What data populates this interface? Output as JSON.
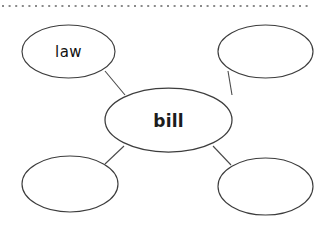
{
  "page": {
    "background_color": "#ffffff",
    "width": 329,
    "height": 230
  },
  "divider": {
    "name": "dotted-rule",
    "style": "dotted",
    "color": "#8a8a8a",
    "y": 6,
    "x_start": 2,
    "x_end": 310,
    "dot_size": 2,
    "dot_gap": 5
  },
  "diagram": {
    "type": "word-web",
    "stroke_color": "#404040",
    "fill_color": "#ffffff",
    "connector_color": "#4a4a4a",
    "center": {
      "id": "center-bubble",
      "label": "bill",
      "cx": 168.5,
      "cy": 120,
      "rx": 63.5,
      "ry": 32,
      "filled": true
    },
    "nodes": [
      {
        "id": "bubble-top-left",
        "label": "law",
        "cx": 68.5,
        "cy": 51.5,
        "rx": 46.5,
        "ry": 26.5,
        "filled": true
      },
      {
        "id": "bubble-top-right",
        "label": "",
        "cx": 265.5,
        "cy": 51.5,
        "rx": 47.5,
        "ry": 26.5,
        "filled": false
      },
      {
        "id": "bubble-bottom-left",
        "label": "",
        "cx": 70,
        "cy": 184,
        "rx": 48,
        "ry": 28,
        "filled": false
      },
      {
        "id": "bubble-bottom-right",
        "label": "",
        "cx": 265.5,
        "cy": 186.5,
        "rx": 47.5,
        "ry": 28.5,
        "filled": false
      }
    ],
    "connectors": [
      {
        "id": "connector-top-left",
        "x1": 105,
        "y1": 71,
        "x2": 125,
        "y2": 95
      },
      {
        "id": "connector-top-right",
        "x1": 232,
        "y1": 95,
        "x2": 228,
        "y2": 71
      },
      {
        "id": "connector-bottom-left",
        "x1": 124,
        "y1": 146,
        "x2": 105,
        "y2": 164
      },
      {
        "id": "connector-bottom-right",
        "x1": 213,
        "y1": 146,
        "x2": 231,
        "y2": 165
      }
    ]
  }
}
